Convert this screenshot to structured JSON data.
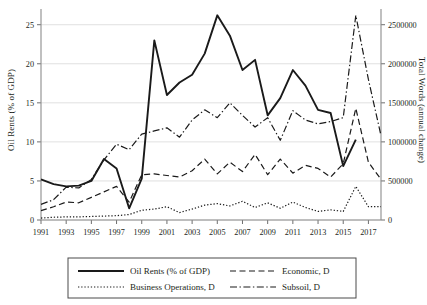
{
  "chart_data": {
    "type": "line",
    "title": "",
    "xlabel": "",
    "ylabel": "Oil Rents (% of GDP)",
    "y2label": "Total Words (annual change)",
    "grid": true,
    "legend_position": "bottom",
    "xlim": [
      1991,
      2018
    ],
    "ylim": [
      0,
      26.5
    ],
    "y2lim": [
      0,
      2650000
    ],
    "xticks": [
      1991,
      1993,
      1995,
      1997,
      1999,
      2001,
      2003,
      2005,
      2007,
      2009,
      2011,
      2013,
      2015,
      2017
    ],
    "xtick_labels": [
      "1991",
      "1993",
      "1995",
      "1997",
      "1999",
      "2001",
      "2003",
      "2005",
      "2007",
      "2009",
      "2011",
      "2013",
      "2015",
      "2017"
    ],
    "yticks": [
      0,
      5,
      10,
      15,
      20,
      25
    ],
    "ytick_labels": [
      "0",
      "5",
      "10",
      "15",
      "20",
      "25"
    ],
    "y2ticks": [
      0,
      500000,
      1000000,
      1500000,
      2000000,
      2500000
    ],
    "y2tick_labels": [
      "0",
      "500000",
      "1000000",
      "1500000",
      "2000000",
      "2500000"
    ],
    "x": [
      1991,
      1992,
      1993,
      1994,
      1995,
      1996,
      1997,
      1998,
      1999,
      2000,
      2001,
      2002,
      2003,
      2004,
      2005,
      2006,
      2007,
      2008,
      2009,
      2010,
      2011,
      2012,
      2013,
      2014,
      2015,
      2016,
      2017,
      2018
    ],
    "series": [
      {
        "name": "Oil Rents (% of GDP)",
        "axis": "left",
        "style": "solid",
        "values": [
          5.2,
          4.6,
          4.3,
          4.4,
          5.0,
          7.8,
          6.6,
          1.5,
          5.3,
          23.0,
          16.0,
          17.6,
          18.6,
          21.3,
          26.2,
          23.6,
          19.2,
          20.5,
          13.4,
          15.6,
          19.2,
          17.2,
          14.1,
          13.7,
          6.9,
          10.3,
          null,
          null
        ]
      },
      {
        "name": "Economic, D",
        "axis": "left",
        "style": "dashed",
        "values": [
          1.2,
          1.7,
          2.3,
          2.2,
          2.9,
          3.6,
          4.3,
          2.3,
          5.8,
          5.9,
          5.7,
          5.5,
          6.3,
          7.8,
          5.9,
          7.4,
          6.2,
          8.4,
          5.8,
          7.8,
          6.0,
          7.0,
          6.6,
          5.5,
          7.2,
          14.3,
          7.4,
          5.2
        ]
      },
      {
        "name": "Business Operations, D",
        "axis": "left",
        "style": "dotted",
        "values": [
          0.25,
          0.35,
          0.4,
          0.4,
          0.45,
          0.5,
          0.55,
          0.7,
          1.25,
          1.4,
          1.7,
          0.95,
          1.4,
          1.9,
          2.1,
          1.8,
          2.4,
          1.6,
          2.2,
          1.5,
          2.3,
          1.6,
          1.1,
          1.3,
          1.1,
          4.3,
          1.7,
          1.7
        ]
      },
      {
        "name": "Subsoil, D",
        "axis": "left",
        "style": "dashdot",
        "values": [
          2.0,
          2.6,
          4.2,
          4.1,
          5.2,
          7.7,
          9.7,
          9.0,
          11.0,
          11.4,
          11.8,
          10.6,
          12.8,
          14.1,
          13.1,
          15.0,
          13.4,
          11.9,
          13.1,
          10.2,
          14.0,
          12.8,
          12.3,
          12.6,
          13.1,
          26.2,
          18.0,
          10.8
        ]
      }
    ]
  },
  "legend": {
    "items": [
      {
        "label": "Oil Rents (% of GDP)",
        "style": "solid"
      },
      {
        "label": "Economic, D",
        "style": "dashed"
      },
      {
        "label": "Business Operations, D",
        "style": "dotted"
      },
      {
        "label": "Subsoil, D",
        "style": "dashdot"
      }
    ]
  }
}
